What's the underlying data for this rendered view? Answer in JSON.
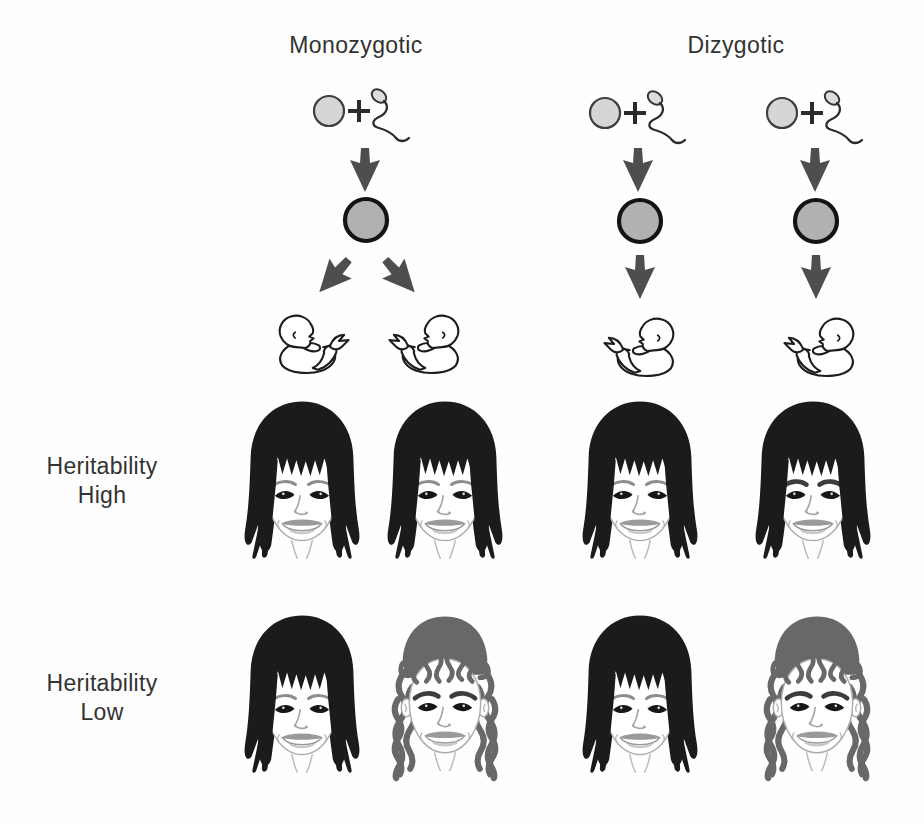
{
  "diagram": {
    "background": "#fefefe",
    "columns": [
      {
        "id": "monozygotic",
        "label": "Monozygotic"
      },
      {
        "id": "dizygotic",
        "label": "Dizygotic"
      }
    ],
    "row_labels": [
      {
        "id": "heritability-high",
        "lines": [
          "Heritability",
          "High"
        ]
      },
      {
        "id": "heritability-low",
        "lines": [
          "Heritability",
          "Low"
        ]
      }
    ],
    "icons": {
      "egg": "egg-cell-icon",
      "plus": "plus-sign",
      "sperm": "sperm-cell-icon",
      "down_arrow": "arrow-down-icon",
      "split_arrows": "diverging-arrows-icon",
      "zygote": "zygote-cell-icon",
      "baby": "newborn-baby-icon",
      "face_straight": "girl-straight-black-hair",
      "face_straight_thick_brows": "girl-straight-black-hair-thick-brows",
      "face_curly": "girl-curly-gray-hair"
    },
    "colors": {
      "hair_black": "#1b1b1b",
      "hair_gray": "#686868",
      "arrow": "#4e4e4e",
      "egg_fill": "#d6d6d6",
      "zygote_fill": "#b1b1b1",
      "text": "#333333",
      "brow": "#8d8d8d",
      "brow_thick": "#3d3d3d"
    }
  }
}
